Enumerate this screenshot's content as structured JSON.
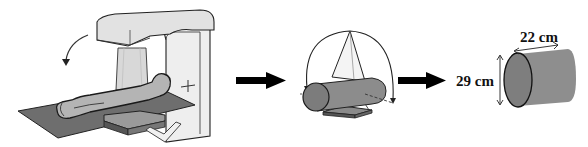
{
  "diagram": {
    "type": "process-flow",
    "stages": [
      {
        "id": "linac",
        "description": "Patient lying on treatment couch under a rotating gantry linear accelerator"
      },
      {
        "id": "arc-geometry",
        "description": "Cylinder phantom with beam cone rotating in an arc around it"
      },
      {
        "id": "phantom",
        "description": "Cylindrical phantom with dimensions"
      }
    ],
    "arrows": [
      {
        "from": "linac",
        "to": "arc-geometry"
      },
      {
        "from": "arc-geometry",
        "to": "phantom"
      }
    ],
    "dimensions": {
      "length_label": "22 cm",
      "diameter_label": "29 cm"
    },
    "colors": {
      "line": "#1a1a1a",
      "gantry_fill": "#e6e6e6",
      "couch_fill": "#6e6e6e",
      "body_fill": "#b4b4b4",
      "cylinder_fill": "#8a8a8a",
      "cylinder_face": "#7a7a7a",
      "arrow": "#000000"
    }
  }
}
